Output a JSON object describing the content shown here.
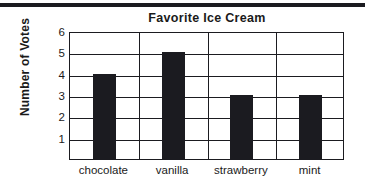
{
  "page": {
    "background_color": "#ffffff",
    "ink_color": "#1b1b20"
  },
  "top_rule": {
    "present": true,
    "color": "#1b1b20"
  },
  "chart_data": {
    "type": "bar",
    "title": "Favorite Ice Cream",
    "xlabel": "",
    "ylabel": "Number of Votes",
    "categories": [
      "chocolate",
      "vanilla",
      "strawberry",
      "mint"
    ],
    "values": [
      4,
      5,
      3,
      3
    ],
    "ylim": [
      0,
      6
    ],
    "ytick_labels": [
      "6",
      "5",
      "4",
      "3",
      "2",
      "1"
    ],
    "ytick_values": [
      6,
      5,
      4,
      3,
      2,
      1
    ],
    "grid": "horizontal-and-category-dividers",
    "legend": "none",
    "bar_color": "#1b1b20",
    "bar_width_px": 23
  }
}
